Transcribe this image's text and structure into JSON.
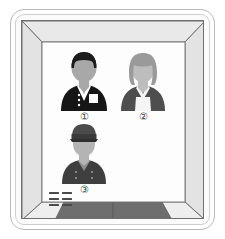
{
  "diagram": {
    "type": "perspective-room-illustration"
  },
  "cabinet": {
    "name": "elevator-car",
    "shell_color": "#b9b9b9",
    "inner_color": "#cfcfcf",
    "wall_color": "#fdfdfd",
    "side_wall_color": "#e6e6e6",
    "outline_color": "#6f6f6f"
  },
  "floor": {
    "name": "elevator-floor",
    "panel_color": "#6e6e6e",
    "side_color": "#eeeeee",
    "panels": 2
  },
  "control_panel": {
    "name": "elevator-control-panel",
    "rows": 3,
    "columns": 2,
    "dash_color": "#4a4a4a"
  },
  "figures": [
    {
      "id": 1,
      "label": "①",
      "name": "person-in-black-jacket",
      "description": "Person wearing a dark jacket with three buttons and a white badge pocket",
      "hair_color": "#1c1c1c",
      "skin_color": "#a8a8a8",
      "clothing_color": "#161616",
      "accent_color": "#ffffff",
      "x": 57,
      "y": 48,
      "width": 52,
      "height": 58
    },
    {
      "id": 2,
      "label": "②",
      "name": "woman-with-apron",
      "description": "Woman with shoulder-length hair wearing a dark dress and white apron",
      "hair_color": "#9a9a9a",
      "skin_color": "#bdbdbd",
      "clothing_color": "#4e4e4e",
      "accent_color": "#f5f5f5",
      "x": 117,
      "y": 50,
      "width": 50,
      "height": 56
    },
    {
      "id": 3,
      "label": "③",
      "name": "uniformed-attendant",
      "description": "Attendant wearing a peaked cap and a double-breasted uniform",
      "hair_color": "#4b4b4b",
      "skin_color": "#b4b4b4",
      "clothing_color": "#3f3f3f",
      "accent_color": "#8e8e8e",
      "x": 58,
      "y": 121,
      "width": 50,
      "height": 58
    }
  ]
}
